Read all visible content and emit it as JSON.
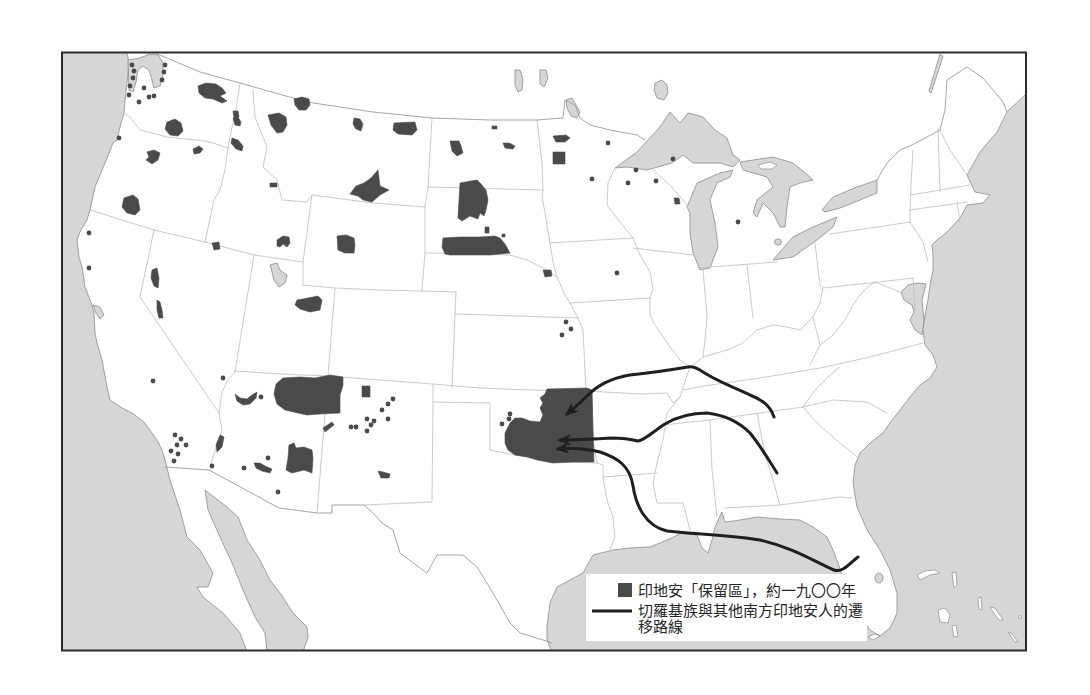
{
  "legend": {
    "reservation": {
      "symbol": "filled-square",
      "label": "印地安「保留區」，約一九〇〇年"
    },
    "route": {
      "symbol": "thick-line",
      "label_lines": [
        "切羅基族與其他南方印地安人的遷",
        "移路線"
      ]
    }
  },
  "colors": {
    "reservation": "#4a4a4a",
    "route": "#1f1f1f",
    "water": "#d6d6d6",
    "land": "#ffffff",
    "coast": "#8c8c8c",
    "border": "#bcbcbc",
    "frame": "#2b2b2b",
    "legend_bg": "#ffffff",
    "text": "#262626"
  },
  "map": {
    "reservations": [
      "M198,86 L206,83 L216,84 L222,88 L226,93 L220,96 L227,101 L222,103 L213,99 L205,98 L199,93 Z",
      "M233,111 L238,111 L239,117 L234,118 Z",
      "M233,118 L238,117 L241,122 L240,126 L235,125 Z",
      "M167,122 L175,119 L181,123 L183,131 L178,136 L170,135 L165,129 Z",
      "M193,149 L199,146 L203,149 L200,153 L194,154 Z",
      "M147,152 L154,150 L160,153 L158,160 L152,164 L146,160 L149,157 Z",
      "M124,198 L133,195 L138,199 L140,210 L135,215 L127,213 L122,207 Z",
      "M232,138 L238,140 L243,146 L242,151 L236,149 L231,143 Z",
      "M270,183 L277,183 L277,187 L270,187 Z",
      "M212,243 L219,242 L220,249 L214,250 Z",
      "M294,99 L302,97 L309,99 L310,105 L306,110 L299,110 L295,105 Z",
      "M268,115 L279,113 L286,117 L287,125 L283,132 L277,133 L271,125 Z",
      "M354,118 L360,119 L363,124 L361,131 L356,129 L353,124 Z",
      "M394,123 L415,122 L417,130 L412,135 L398,134 L393,130 Z",
      "M371,178 L378,170 L380,186 L389,190 L380,195 L372,202 L363,200 L358,196 L350,194 L356,186 L364,183 Z",
      "M450,141 L459,141 L461,146 L463,153 L457,156 L452,151 Z",
      "M492,126 L497,126 L497,129 L492,129 Z",
      "M503,143 L509,143 L515,146 L513,149 L505,148 Z",
      "M553,136 L566,135 L570,138 L565,142 L556,142 Z",
      "M553,152 L565,152 L565,164 L553,164 Z",
      "M460,183 L471,181 L477,180 L481,184 L486,190 L488,200 L486,210 L484,216 L480,213 L478,219 L470,216 L462,221 L458,218 L459,200 Z",
      "M443,238 L460,237 L480,237 L495,236 L500,238 L505,244 L510,253 L490,255 L470,255 L450,255 L445,254 L442,247 Z",
      "M485,227 L489,227 L489,233 L485,233 Z",
      "M502,234 L505,234 L505,237 L502,237 Z",
      "M337,236 L346,235 L354,238 L355,245 L354,253 L345,253 L338,250 Z",
      "M277,240 L283,236 L289,237 L290,243 L287,247 L283,244 L280,247 L277,246 Z",
      "M543,270 L551,270 L552,276 L545,277 Z",
      "M674,198 L679,198 L680,204 L675,204 Z",
      "M297,300 L308,298 L318,296 L322,300 L320,310 L310,312 L300,309 L295,305 Z",
      "M152,270 L157,268 L159,278 L158,288 L154,286 L151,278 Z",
      "M157,300 L160,302 L162,310 L163,318 L159,318 L157,310 Z",
      "M276,384 L283,378 L300,377 L315,378 L330,375 L343,377 L343,385 L340,395 L340,413 L320,414 L307,415 L298,413 L285,410 L277,404 L274,394 Z",
      "M235,394 L240,398 L247,399 L252,395 L257,392 L256,398 L250,404 L243,405 L237,401 Z",
      "M220,435 L224,437 L222,447 L217,452 L216,445 Z",
      "M254,463 L260,463 L265,466 L272,469 L270,473 L262,471 L256,468 Z",
      "M289,445 L294,443 L296,448 L304,447 L312,450 L313,458 L312,473 L304,470 L292,473 L286,470 L288,458 Z",
      "M362,386 L370,386 L370,397 L362,397 Z",
      "M323,428 L332,422 L334,425 L325,432 Z",
      "M378,471 L383,472 L390,474 L389,478 L381,478 Z",
      "M547,389 L587,388 L592,390 L593,430 L594,462 L573,462 L553,463 L537,460 L527,457 L515,455 L508,450 L505,443 L505,433 L510,423 L515,418 L522,418 L530,421 L540,422 L543,415 L540,408 L543,403 L540,398 L545,394 Z"
    ],
    "reservation_points": [
      [
        132,
        65
      ],
      [
        134,
        71
      ],
      [
        133,
        78
      ],
      [
        130,
        86
      ],
      [
        129,
        95
      ],
      [
        144,
        88
      ],
      [
        139,
        102
      ],
      [
        149,
        97
      ],
      [
        154,
        96
      ],
      [
        165,
        65
      ],
      [
        164,
        72
      ],
      [
        162,
        80
      ],
      [
        119,
        138
      ],
      [
        89,
        233
      ],
      [
        89,
        268
      ],
      [
        153,
        381
      ],
      [
        223,
        378
      ],
      [
        175,
        435
      ],
      [
        181,
        439
      ],
      [
        177,
        445
      ],
      [
        186,
        445
      ],
      [
        171,
        451
      ],
      [
        178,
        454
      ],
      [
        174,
        461
      ],
      [
        212,
        466
      ],
      [
        244,
        468
      ],
      [
        268,
        458
      ],
      [
        278,
        492
      ],
      [
        261,
        397
      ],
      [
        351,
        427
      ],
      [
        356,
        427
      ],
      [
        367,
        419
      ],
      [
        374,
        421
      ],
      [
        371,
        425
      ],
      [
        367,
        431
      ],
      [
        382,
        410
      ],
      [
        388,
        404
      ],
      [
        393,
        399
      ],
      [
        388,
        419
      ],
      [
        608,
        143
      ],
      [
        636,
        170
      ],
      [
        673,
        159
      ],
      [
        592,
        179
      ],
      [
        628,
        183
      ],
      [
        656,
        181
      ],
      [
        738,
        222
      ],
      [
        617,
        273
      ],
      [
        566,
        322
      ],
      [
        571,
        329
      ],
      [
        562,
        335
      ],
      [
        510,
        414
      ],
      [
        509,
        419
      ],
      [
        502,
        424
      ]
    ],
    "migration_routes": [
      "M774,417 C770,405 762,400 750,395 C735,388 715,380 703,372 C697,368 693,366 688,367 C670,370 650,373 630,375 C612,378 598,385 588,395 C580,403 574,408 567,414",
      "M777,473 C770,462 760,445 750,433 C740,423 725,415 707,413 C690,413 675,418 665,424 C655,430 645,440 638,441 C630,439 622,438 612,438 C595,439 580,440 560,440",
      "M858,557 C850,563 843,573 834,570 C815,562 795,548 760,540 C725,534 690,534 667,531 C645,526 636,505 633,486 C630,466 618,458 600,452 C585,448 570,448 558,449"
    ]
  }
}
